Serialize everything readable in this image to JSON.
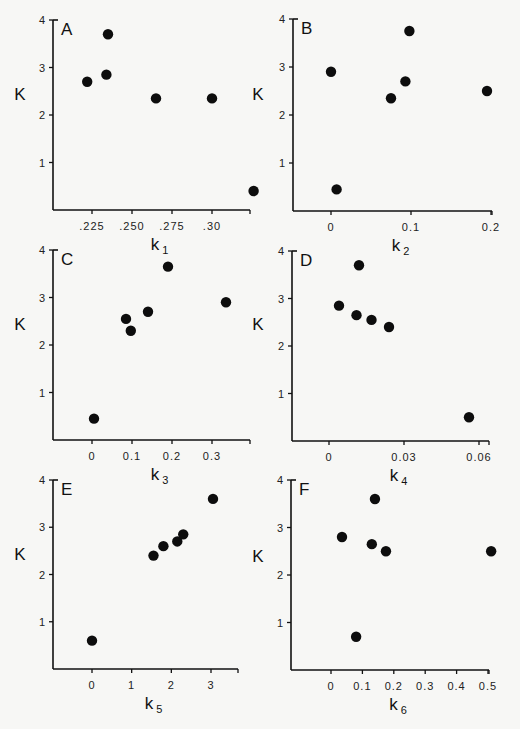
{
  "chart_data": [
    {
      "panel": "A",
      "type": "scatter",
      "xlabel": "k1",
      "ylabel": "K",
      "xticks": [
        ".225",
        ".250",
        ".275",
        ".30"
      ],
      "xtick_values": [
        0.225,
        0.25,
        0.275,
        0.3
      ],
      "yticks": [
        "1",
        "2",
        "3",
        "4"
      ],
      "ylim": [
        0,
        4
      ],
      "points": [
        [
          0.222,
          2.7
        ],
        [
          0.234,
          2.85
        ],
        [
          0.235,
          3.7
        ],
        [
          0.265,
          2.35
        ],
        [
          0.3,
          2.35
        ],
        [
          0.326,
          0.4
        ]
      ]
    },
    {
      "panel": "B",
      "type": "scatter",
      "xlabel": "k2",
      "ylabel": "K",
      "xticks": [
        "0",
        "0.1",
        "0.2"
      ],
      "xtick_values": [
        0,
        0.1,
        0.2
      ],
      "yticks": [
        "1",
        "2",
        "3",
        "4"
      ],
      "ylim": [
        0,
        4
      ],
      "points": [
        [
          0.0,
          2.9
        ],
        [
          0.007,
          0.45
        ],
        [
          0.075,
          2.35
        ],
        [
          0.093,
          2.7
        ],
        [
          0.098,
          3.75
        ],
        [
          0.195,
          2.5
        ]
      ]
    },
    {
      "panel": "C",
      "type": "scatter",
      "xlabel": "k3",
      "ylabel": "K",
      "xticks": [
        "0",
        "0.1",
        "0.2",
        "0.3"
      ],
      "xtick_values": [
        0,
        0.1,
        0.2,
        0.3
      ],
      "yticks": [
        "1",
        "2",
        "3",
        "4"
      ],
      "ylim": [
        0,
        4
      ],
      "points": [
        [
          0.005,
          0.45
        ],
        [
          0.085,
          2.55
        ],
        [
          0.097,
          2.3
        ],
        [
          0.14,
          2.7
        ],
        [
          0.19,
          3.65
        ],
        [
          0.335,
          2.9
        ]
      ]
    },
    {
      "panel": "D",
      "type": "scatter",
      "xlabel": "k4",
      "ylabel": "K",
      "xticks": [
        "0",
        "0.03",
        "0.06"
      ],
      "xtick_values": [
        0,
        0.03,
        0.06
      ],
      "yticks": [
        "1",
        "2",
        "3",
        "4"
      ],
      "ylim": [
        0,
        4
      ],
      "points": [
        [
          0.004,
          2.85
        ],
        [
          0.011,
          2.65
        ],
        [
          0.012,
          3.7
        ],
        [
          0.017,
          2.55
        ],
        [
          0.024,
          2.4
        ],
        [
          0.056,
          0.5
        ]
      ]
    },
    {
      "panel": "E",
      "type": "scatter",
      "xlabel": "k5",
      "ylabel": "K",
      "xticks": [
        "0",
        "1",
        "2",
        "3"
      ],
      "xtick_values": [
        0,
        1,
        2,
        3
      ],
      "yticks": [
        "1",
        "2",
        "3",
        "4"
      ],
      "ylim": [
        0,
        4
      ],
      "points": [
        [
          0.0,
          0.6
        ],
        [
          1.55,
          2.4
        ],
        [
          1.8,
          2.6
        ],
        [
          2.15,
          2.7
        ],
        [
          2.3,
          2.85
        ],
        [
          3.05,
          3.6
        ]
      ]
    },
    {
      "panel": "F",
      "type": "scatter",
      "xlabel": "k6",
      "ylabel": "K",
      "xticks": [
        "0",
        "0.1",
        "0.2",
        "0.3",
        "0.4",
        "0.5"
      ],
      "xtick_values": [
        0,
        0.1,
        0.2,
        0.3,
        0.4,
        0.5
      ],
      "yticks": [
        "1",
        "2",
        "3",
        "4"
      ],
      "ylim": [
        0,
        4
      ],
      "points": [
        [
          0.035,
          2.8
        ],
        [
          0.08,
          0.7
        ],
        [
          0.13,
          2.65
        ],
        [
          0.14,
          3.6
        ],
        [
          0.175,
          2.5
        ],
        [
          0.51,
          2.5
        ]
      ]
    }
  ]
}
